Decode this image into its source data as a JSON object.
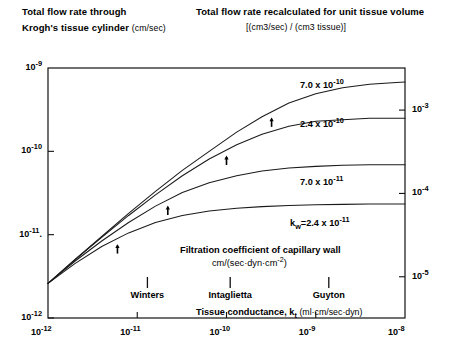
{
  "header": {
    "left_line1": "Total flow rate through",
    "left_line2": "Krogh's tissue cylinder",
    "left_units": "(cm/sec)",
    "right_line1": "Total flow rate recalculated for unit tissue volume",
    "right_line2": "[(cm3/sec) / (cm3 tissue)]"
  },
  "axes": {
    "left_ticks": [
      "10-9",
      "10-10",
      "10-11.",
      "10-12"
    ],
    "right_ticks": [
      "10-3",
      "10-4",
      "10-5"
    ],
    "bottom_ticks": [
      "10-12",
      "10-11",
      "10-10",
      "10-9",
      "10-8"
    ]
  },
  "curve_labels": [
    "7.0 x 10-10",
    "2.4 x 10-10",
    "7.0 x 10-11",
    "kw=2.4 x 10-11"
  ],
  "annotations": {
    "filtration_title": "Filtration coefficient of capillary wall",
    "filtration_units": "cm/(sec·dyn·cm-2)",
    "markers": [
      "Winters",
      "Intaglietta",
      "Guyton"
    ],
    "conductance_label": "Tissue conductance,",
    "conductance_symbol": "kt",
    "conductance_units": "(ml·cm/sec·dyn)"
  },
  "colors": {
    "ink": "#000000",
    "frame": "#111111",
    "curve": "#1a1a1a",
    "background": "#ffffff"
  },
  "chart_data": {
    "type": "line",
    "xlabel": "Tissue conductance, kt (ml·cm/sec·dyn)",
    "ylabel": "Total flow rate through Krogh's tissue cylinder (cm/sec)",
    "ylabel_right": "Total flow rate recalculated for unit tissue volume [(cm3/sec)/(cm3 tissue)]",
    "xscale": "log",
    "yscale": "log",
    "xlim": [
      1e-12,
      1e-08
    ],
    "ylim": [
      1e-12,
      1e-09
    ],
    "ylim_right": [
      3.2e-06,
      0.0032
    ],
    "grid": false,
    "legend": "inline-labels",
    "xticks": [
      1e-12,
      1e-11,
      1e-10,
      1e-09,
      1e-08
    ],
    "yticks": [
      1e-12,
      1e-11,
      1e-10,
      1e-09
    ],
    "yticks_right": [
      1e-05,
      0.0001,
      0.001
    ],
    "series": [
      {
        "name": "7.0 x 10-10",
        "kw": 7e-10,
        "arrow_x": 3.2e-10,
        "x": [
          1e-12,
          2e-12,
          4e-12,
          8e-12,
          1.6e-11,
          3.2e-11,
          6.4e-11,
          1.3e-10,
          2.5e-10,
          5e-10,
          1e-09,
          2e-09,
          4e-09,
          8e-09,
          1e-08
        ],
        "y": [
          2.6e-12,
          5e-12,
          9.5e-12,
          1.8e-11,
          3.3e-11,
          5.9e-11,
          1e-10,
          1.7e-10,
          2.6e-10,
          3.8e-10,
          4.9e-10,
          5.8e-10,
          6.4e-10,
          6.7e-10,
          6.8e-10
        ]
      },
      {
        "name": "2.4 x 10-10",
        "kw": 2.4e-10,
        "arrow_x": 1e-10,
        "x": [
          1e-12,
          2e-12,
          4e-12,
          8e-12,
          1.6e-11,
          3.2e-11,
          6.4e-11,
          1.3e-10,
          2.5e-10,
          5e-10,
          1e-09,
          2e-09,
          4e-09,
          8e-09,
          1e-08
        ],
        "y": [
          2.6e-12,
          5e-12,
          9.3e-12,
          1.7e-11,
          3e-11,
          5.1e-11,
          8.1e-11,
          1.2e-10,
          1.6e-10,
          2e-10,
          2.3e-10,
          2.4e-10,
          2.5e-10,
          2.5e-10,
          2.5e-10
        ]
      },
      {
        "name": "7.0 x 10-11",
        "kw": 7e-11,
        "arrow_x": 2.2e-11,
        "x": [
          1e-12,
          2e-12,
          4e-12,
          8e-12,
          1.6e-11,
          3.2e-11,
          6.4e-11,
          1.3e-10,
          2.5e-10,
          5e-10,
          1e-09,
          2e-09,
          4e-09,
          8e-09,
          1e-08
        ],
        "y": [
          2.6e-12,
          4.8e-12,
          8.4e-12,
          1.4e-11,
          2.2e-11,
          3.2e-11,
          4.2e-11,
          5.1e-11,
          5.8e-11,
          6.3e-11,
          6.6e-11,
          6.8e-11,
          6.9e-11,
          6.9e-11,
          6.9e-11
        ]
      },
      {
        "name": "kw=2.4 x 10-11",
        "kw": 2.4e-11,
        "arrow_x": 6e-12,
        "x": [
          1e-12,
          2e-12,
          4e-12,
          8e-12,
          1.6e-11,
          3.2e-11,
          6.4e-11,
          1.3e-10,
          2.5e-10,
          5e-10,
          1e-09,
          2e-09,
          4e-09,
          8e-09,
          1e-08
        ],
        "y": [
          2.6e-12,
          4.5e-12,
          7.2e-12,
          1.05e-11,
          1.4e-11,
          1.7e-11,
          1.92e-11,
          2.07e-11,
          2.17e-11,
          2.24e-11,
          2.28e-11,
          2.31e-11,
          2.33e-11,
          2.34e-11,
          2.34e-11
        ]
      }
    ],
    "marker_ticks": [
      {
        "label": "Winters",
        "x": 1.3e-11
      },
      {
        "label": "Intaglietta",
        "x": 1.1e-10
      },
      {
        "label": "Guyton",
        "x": 1.4e-09
      }
    ]
  }
}
